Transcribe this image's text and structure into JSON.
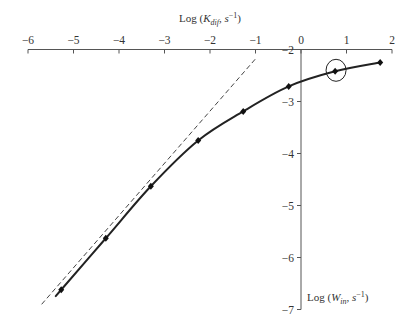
{
  "chart_data": {
    "type": "line",
    "title": "",
    "xlabel": "Log (K_dif, s^-1)",
    "xlabel_parts": {
      "prefix": "Log (",
      "var": "K",
      "sub": "dif",
      "suffix": ", s",
      "sup": "−1",
      "close": ")"
    },
    "ylabel": "Log (W_in, s^-1)",
    "ylabel_parts": {
      "prefix": "Log (",
      "var": "W",
      "sub": "in",
      "suffix": ", s",
      "sup": "−1",
      "close": ")"
    },
    "xlim": [
      -6,
      2
    ],
    "ylim": [
      -7,
      -2
    ],
    "x_ticks": [
      -6,
      -5,
      -4,
      -3,
      -2,
      -1,
      0,
      1,
      2
    ],
    "x_tick_labels": [
      "−6",
      "−5",
      "−4",
      "−3",
      "−2",
      "−1",
      "0",
      "1",
      "2"
    ],
    "y_ticks": [
      -2,
      -3,
      -4,
      -5,
      -6,
      -7
    ],
    "y_tick_labels": [
      "−2",
      "−3",
      "−4",
      "−5",
      "−6",
      "−7"
    ],
    "x_axis_position": "top",
    "y_axis_position": "x=0",
    "grid": false,
    "series": [
      {
        "name": "measured",
        "style": "markers+smooth-line",
        "marker": "diamond",
        "x": [
          -5.27,
          -4.29,
          -3.3,
          -2.26,
          -1.27,
          -0.27,
          0.75,
          1.74
        ],
        "y": [
          -6.62,
          -5.63,
          -4.63,
          -3.75,
          -3.19,
          -2.71,
          -2.42,
          -2.25
        ]
      },
      {
        "name": "asymptote",
        "style": "dashed-line",
        "x": [
          -5.7,
          -0.99
        ],
        "y": [
          -6.9,
          -2.17
        ]
      }
    ],
    "annotations": [
      {
        "type": "circle",
        "x": 0.77,
        "y": -2.4,
        "note": "highlighted point"
      }
    ]
  }
}
